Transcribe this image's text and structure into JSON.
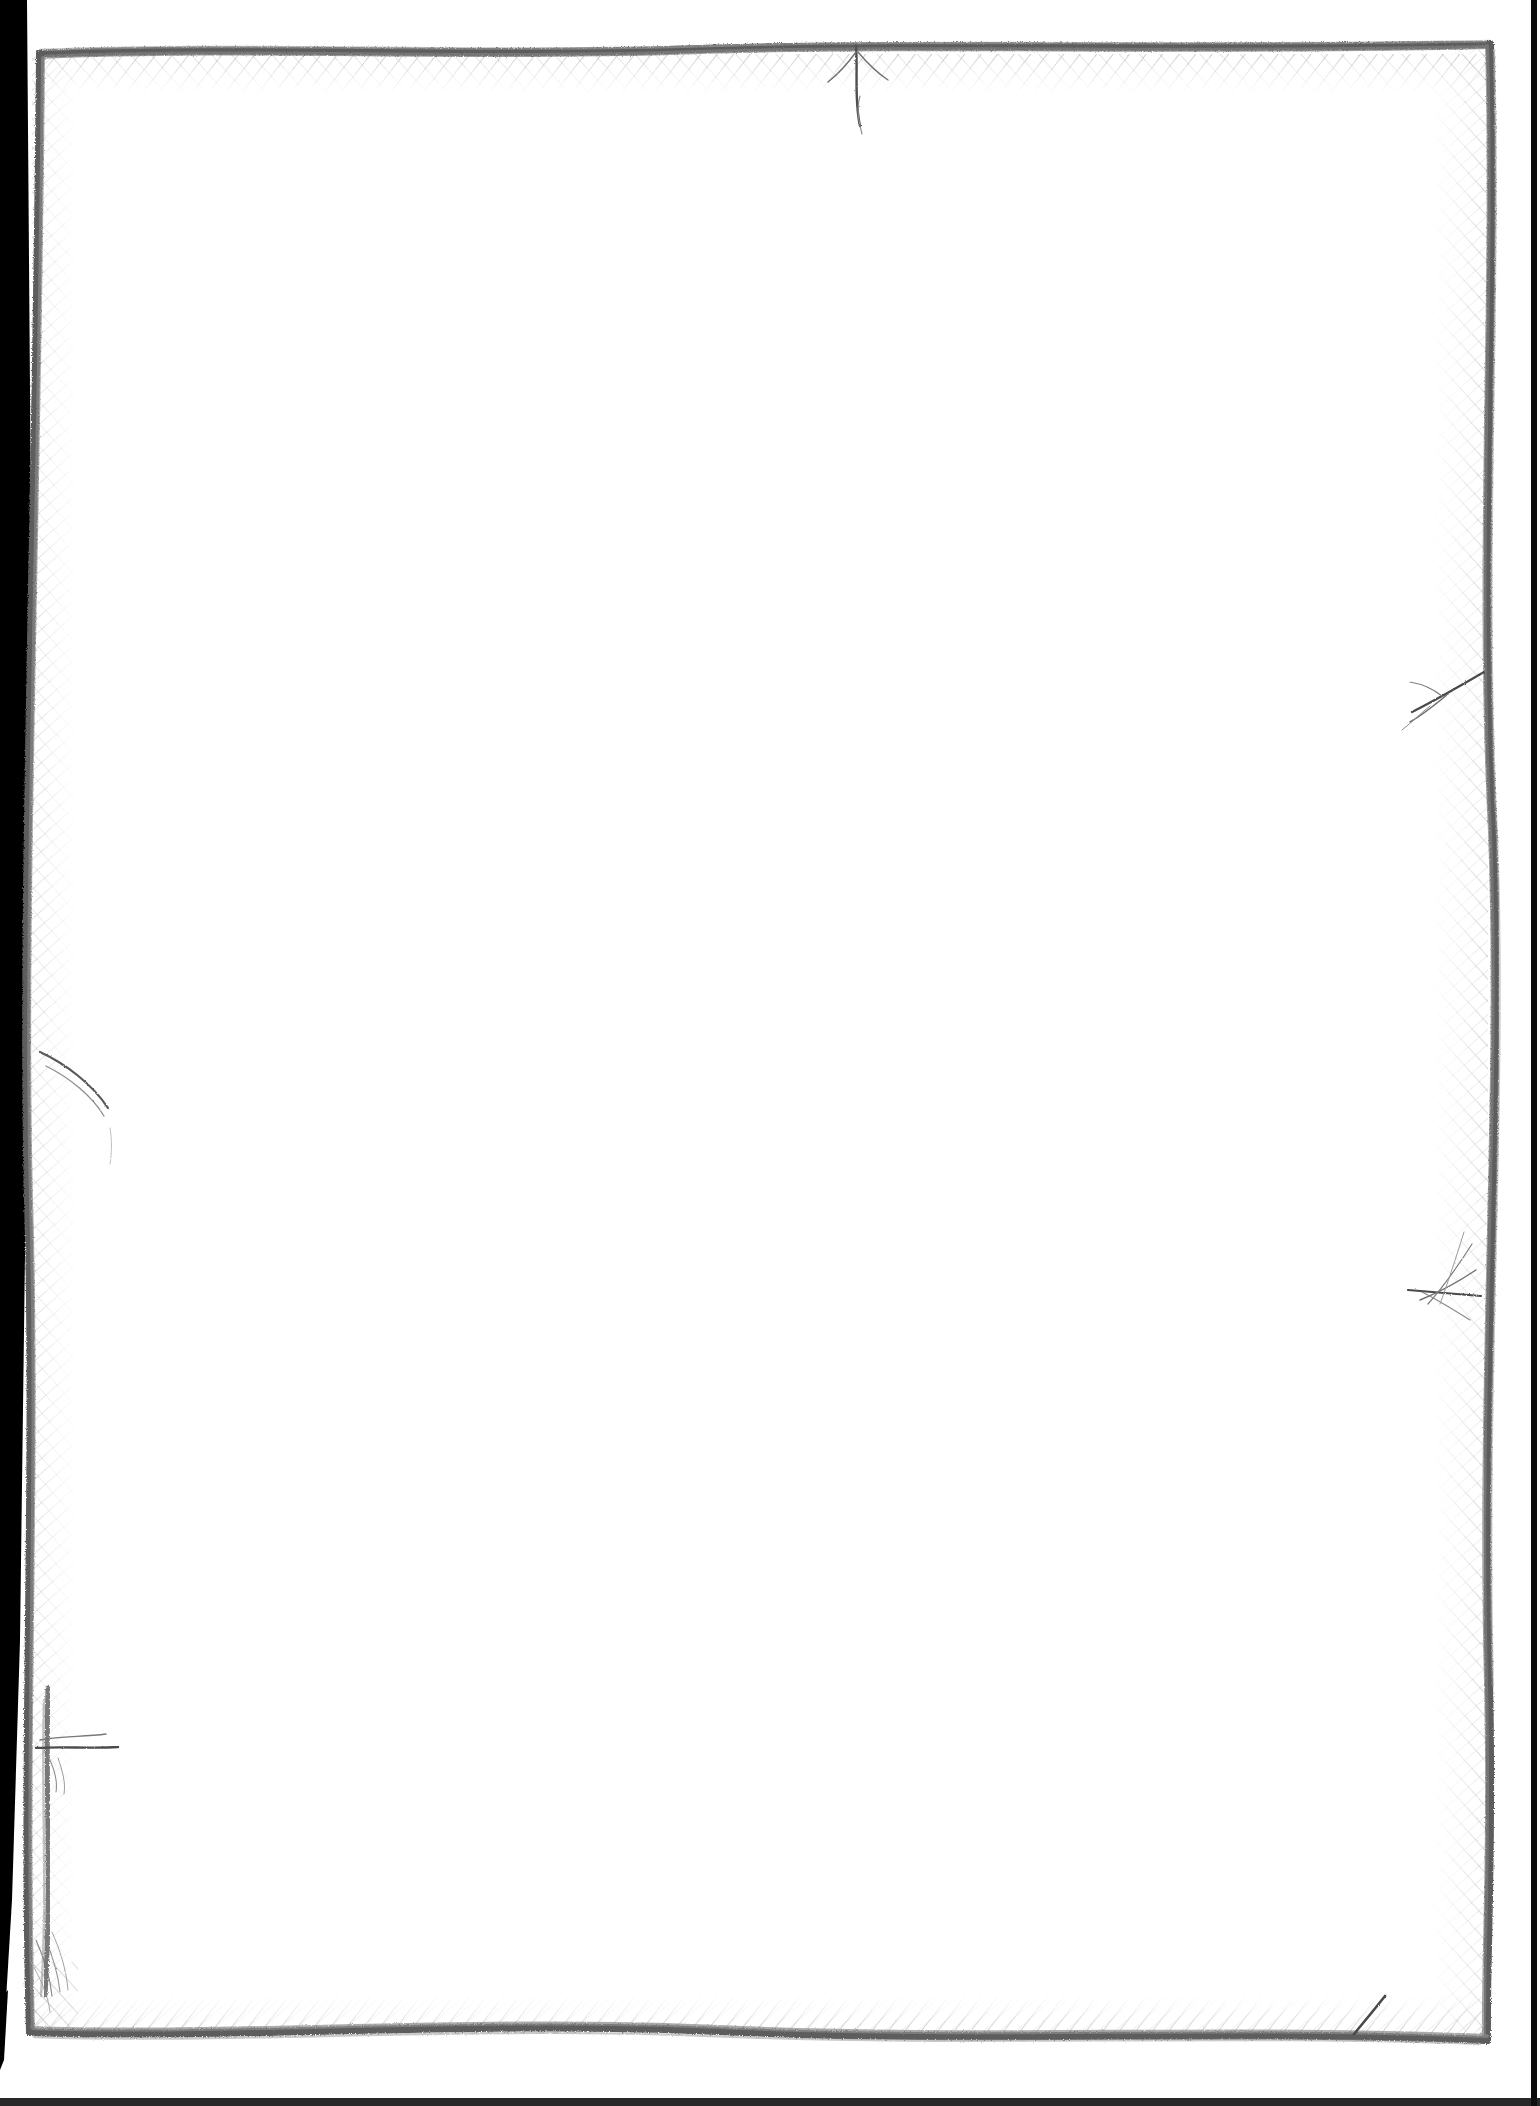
{
  "document": {
    "kind": "scanned-page",
    "page_content_text": "",
    "body_text": "",
    "note": "blank page",
    "canvas": {
      "width": 1540,
      "height": 2106
    }
  },
  "colors": {
    "paper": "#ffffff",
    "pencil_dark": "#5a5a5a",
    "pencil_mid": "#7c7c7c",
    "pencil_light": "#a9a9a9",
    "hatch": "#8e8e8e",
    "scan_edge_black": "#000000"
  },
  "scan_edge": {
    "name": "scanner-shadow-left",
    "side": "left",
    "top_width": 26,
    "bottom_width": 8,
    "right_strip_x": 1531,
    "right_strip_width": 5
  },
  "border_frame": {
    "name": "hand-drawn-pencil-rectangle",
    "stroke_style": "pencil",
    "corners": {
      "top_left": [
        40,
        52
      ],
      "top_right": [
        1490,
        44
      ],
      "bottom_right": [
        1487,
        2040
      ],
      "bottom_left": [
        30,
        2032
      ]
    },
    "top_edge_path": "M 40 54 C 240 45, 470 56, 700 49 C 930 43, 1180 50, 1490 44",
    "right_edge_path": "M 1490 44 C 1496 330, 1478 620, 1492 900 C 1500 1180, 1480 1470, 1487 2040",
    "bottom_edge_path": "M 1487 2040 C 1230 2029, 980 2042, 720 2031 C 470 2021, 230 2038, 30 2032",
    "left_edge_path": "M 30 2032 C 22 1740, 36 1440, 28 1140 C 20 840, 38 480, 40 54",
    "double_line_segment": {
      "name": "left-edge-doubled-stroke",
      "path": "M 46 1690 C 44 1790, 50 1880, 44 1990"
    }
  },
  "hatching": {
    "name": "crosshatch-shading",
    "regions": [
      {
        "edge": "top",
        "inward_depth": 34,
        "angle_deg": 38
      },
      {
        "edge": "right",
        "inward_depth": 42,
        "angle_deg": 42
      },
      {
        "edge": "bottom",
        "inward_depth": 28,
        "angle_deg": 34
      },
      {
        "edge": "left",
        "inward_depth": 30,
        "angle_deg": 46
      }
    ]
  },
  "stray_marks": [
    {
      "name": "top-spike-mark",
      "x": 855,
      "y": 60,
      "kind": "downward-spike"
    },
    {
      "name": "right-branch-mark",
      "x": 1460,
      "y": 690,
      "kind": "branching-whisker"
    },
    {
      "name": "right-starburst-mark",
      "x": 1455,
      "y": 1290,
      "kind": "starburst"
    },
    {
      "name": "left-curved-mark",
      "x": 52,
      "y": 1085,
      "kind": "curved-arc"
    },
    {
      "name": "left-horizontal-mark",
      "x": 60,
      "y": 1745,
      "kind": "horizontal-whisker"
    },
    {
      "name": "bottom-diagonal-mark",
      "x": 1370,
      "y": 2005,
      "kind": "diagonal-stroke"
    },
    {
      "name": "bottom-left-fray-mark",
      "x": 40,
      "y": 1960,
      "kind": "frayed-bristles"
    }
  ]
}
